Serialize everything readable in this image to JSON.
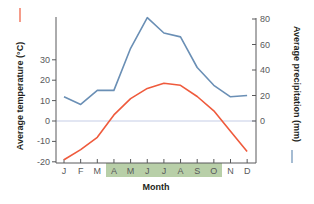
{
  "chart_data": {
    "type": "line",
    "title": "",
    "xlabel": "Month",
    "categories": [
      "J",
      "F",
      "M",
      "A",
      "M",
      "J",
      "J",
      "A",
      "S",
      "O",
      "N",
      "D"
    ],
    "highlight_months": {
      "start_index": 3,
      "end_index": 9,
      "color": "#b8cfa8"
    },
    "series": [
      {
        "name": "Average temperature (°C)",
        "axis": "left",
        "color": "#ef5a3c",
        "values": [
          -19,
          -14,
          -8,
          3,
          11,
          16,
          18.5,
          17.5,
          12,
          5,
          -5,
          -15
        ]
      },
      {
        "name": "Average precipitation (mm)",
        "axis": "right",
        "color": "#6a8fb5",
        "values": [
          19,
          13,
          24,
          24,
          57,
          81,
          69,
          66,
          42,
          28,
          19,
          20
        ]
      }
    ],
    "left_axis": {
      "label": "Average temperature (°C)",
      "ticks": [
        -20,
        -10,
        0,
        10,
        20,
        30
      ],
      "ylim": [
        -20,
        30
      ]
    },
    "right_axis": {
      "label": "Average precipitation (mm)",
      "ticks": [
        0,
        20,
        40,
        60,
        80
      ],
      "ylim": [
        0,
        80
      ]
    },
    "zero_line": {
      "color": "#c5cde6"
    },
    "grid": false,
    "legend": "axis-label color markers"
  },
  "labels": {
    "xlabel": "Month",
    "left_axis_label": "Average temperature (°C)",
    "right_axis_label": "Average precipitation (mm)",
    "left_ticks": [
      "30",
      "20",
      "10",
      "0",
      "-10",
      "-20"
    ],
    "right_ticks": [
      "80",
      "60",
      "40",
      "20",
      "0"
    ],
    "months": [
      "J",
      "F",
      "M",
      "A",
      "M",
      "J",
      "J",
      "A",
      "S",
      "O",
      "N",
      "D"
    ]
  }
}
